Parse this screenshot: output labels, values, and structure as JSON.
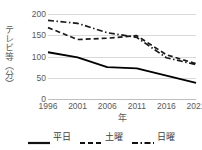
{
  "chart_data": {
    "type": "line",
    "title": "",
    "xlabel": "年",
    "ylabel": "テレビ等（分）",
    "x": [
      1996,
      2001,
      2006,
      2011,
      2016,
      2021
    ],
    "xtick_labels": [
      "1996",
      "2001",
      "2006",
      "2011",
      "2016",
      "2021"
    ],
    "ytick_labels": [
      "0",
      "50",
      "100",
      "150",
      "200"
    ],
    "yticks": [
      0,
      50,
      100,
      150,
      200
    ],
    "ylim": [
      0,
      200
    ],
    "grid": true,
    "legend_position": "bottom",
    "series": [
      {
        "name": "平日",
        "style": "solid",
        "color": "#000000",
        "values": [
          110,
          98,
          75,
          72,
          55,
          38
        ]
      },
      {
        "name": "土曜",
        "style": "dashed",
        "color": "#1a1a1a",
        "values": [
          168,
          140,
          143,
          149,
          104,
          83
        ]
      },
      {
        "name": "日曜",
        "style": "dashdot",
        "color": "#1a1a1a",
        "values": [
          185,
          178,
          156,
          145,
          97,
          81
        ]
      }
    ]
  },
  "legend": {
    "items": [
      {
        "label": "平日",
        "style": "solid"
      },
      {
        "label": "土曜",
        "style": "dashed"
      },
      {
        "label": "日曜",
        "style": "dashdot"
      }
    ]
  },
  "colors": {
    "gridline": "#d9d9d9",
    "axis": "#bfbfbf",
    "text": "#595959",
    "line": "#000000",
    "background": "#ffffff"
  }
}
